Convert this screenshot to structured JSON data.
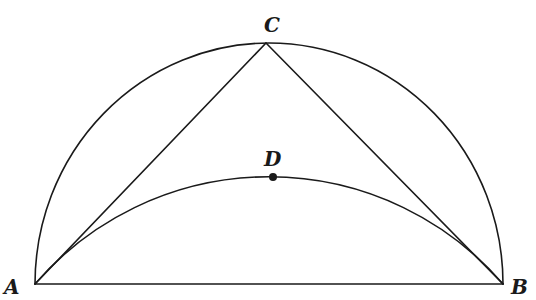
{
  "diagram": {
    "type": "geometry",
    "colors": {
      "stroke": "#1a1a1a",
      "background": "#ffffff"
    },
    "points": {
      "A": {
        "label": "A",
        "x": 35,
        "y": 284
      },
      "B": {
        "label": "B",
        "x": 503,
        "y": 284
      },
      "C": {
        "label": "C",
        "x": 266,
        "y": 43
      },
      "D": {
        "label": "D",
        "x": 266,
        "y": 177
      }
    },
    "shapes": {
      "semicircle": {
        "center": [
          269,
          284
        ],
        "radius": 234
      },
      "arc_ADB": {
        "through": [
          "A",
          "D",
          "B"
        ],
        "radius": 309
      },
      "segments": [
        "AB",
        "AC",
        "CB"
      ]
    }
  }
}
